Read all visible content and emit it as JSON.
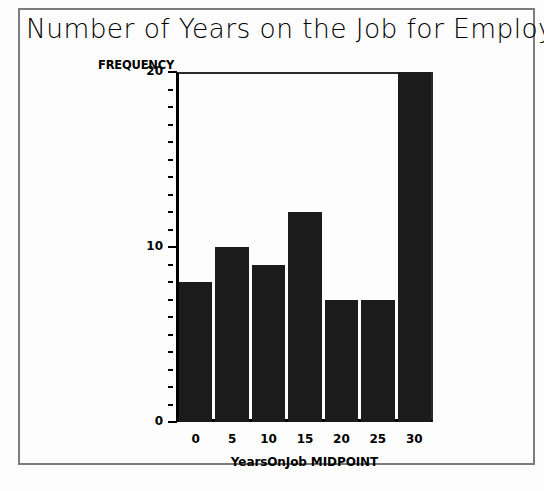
{
  "figure": {
    "title": "Number of Years on the Job for Employees",
    "background_color": "#fdfdfd",
    "frame_color": "#7c7c7c"
  },
  "chart_data": {
    "type": "bar",
    "title": "Number of Years on the Job for Employees",
    "xlabel": "YearsOnJob MIDPOINT",
    "ylabel": "FREQUENCY",
    "categories": [
      "0",
      "5",
      "10",
      "15",
      "20",
      "25",
      "30"
    ],
    "values": [
      8,
      10,
      9,
      12,
      7,
      7,
      20
    ],
    "ylim": [
      0,
      20
    ],
    "ytick_labels": [
      "0",
      "10",
      "20"
    ],
    "ytick_values": [
      0,
      10,
      20
    ],
    "minor_tick_step": 1,
    "grid": false,
    "legend": false,
    "bar_color": "#1b1b1b",
    "axis_color": "#000000"
  }
}
